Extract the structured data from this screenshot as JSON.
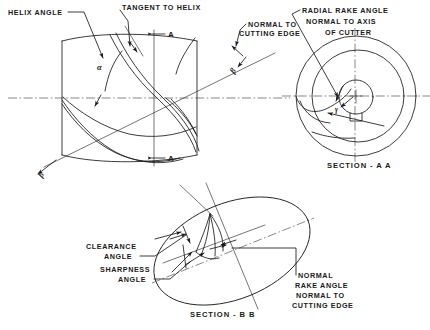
{
  "figure": {
    "ink_color": "#1a1a1a",
    "background_color": "#ffffff",
    "centerline_color": "#555555"
  },
  "labels": {
    "helix_angle": "HELIX ANGLE",
    "tangent_to_helix": "TANGENT TO HELIX",
    "normal_to_line1": "NORMAL TO",
    "normal_to_line2": "CUTTING EDGE",
    "radial_rake_line1": "RADIAL RAKE ANGLE",
    "radial_rake_line2": "NORMAL TO AXIS",
    "radial_rake_line3": "OF CUTTER",
    "section_aa": "SECTION - A A",
    "section_bb": "SECTION - B B",
    "clearance_line1": "CLEARANCE",
    "clearance_line2": "ANGLE",
    "sharpness_line1": "SHARPNESS",
    "sharpness_line2": "ANGLE",
    "normal_rake_line1": "NORMAL",
    "normal_rake_line2": "RAKE ANGLE",
    "normal_rake_line3": "NORMAL TO",
    "normal_rake_line4": "CUTTING EDGE"
  },
  "symbols": {
    "alpha": "α",
    "beta_top": "β",
    "beta_bottom": "β",
    "gamma": "γ"
  },
  "section_marks": {
    "a_top": "A",
    "a_bottom": "A"
  },
  "views": [
    {
      "name": "cutter-body-helix-view",
      "description": "Cylindrical milling cutter body with helical flutes, helix angle alpha, tangent to helix, and A-A / B-B section cutting planes"
    },
    {
      "name": "section-aa-view",
      "description": "End view circular section A-A showing radial rake angle gamma normal to axis of cutter, outer diameter, flutes, bore and keyway"
    },
    {
      "name": "section-bb-view",
      "description": "Oblique section B-B ellipse showing clearance angle, sharpness angle and normal rake angle normal to cutting edge"
    }
  ]
}
